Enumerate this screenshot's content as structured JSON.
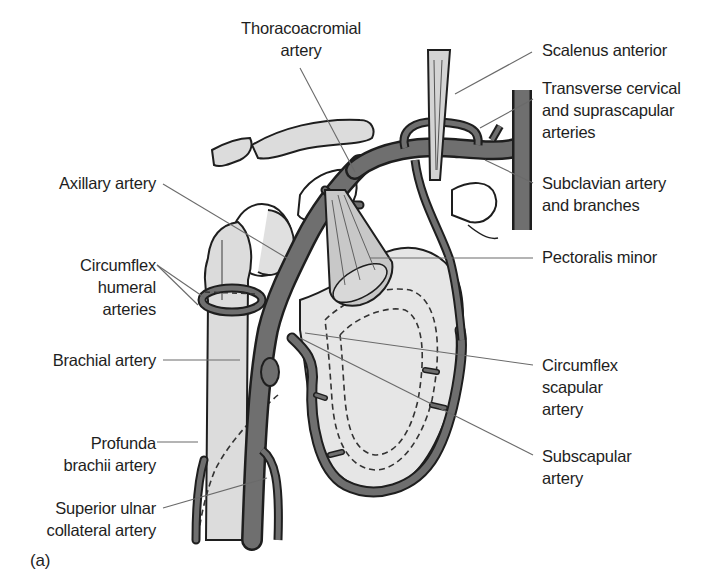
{
  "figure": {
    "panel_label": "(a)",
    "colors": {
      "artery": "#6f6f6f",
      "outline": "#1e1e1e",
      "bone": "#dcdcdc",
      "scapula": "#e6e6e6",
      "muscle": "#c8c8c8",
      "leader": "#6a6a6a"
    }
  },
  "labels": {
    "thoracoacromial": [
      "Thoracoacromial",
      "artery"
    ],
    "scalenus": [
      "Scalenus anterior"
    ],
    "transverse": [
      "Transverse cervical",
      "and suprascapular",
      "arteries"
    ],
    "subclavian": [
      "Subclavian artery",
      "and branches"
    ],
    "axillary": [
      "Axillary artery"
    ],
    "pectoralis": [
      "Pectoralis minor"
    ],
    "circumflex_humeral": [
      "Circumflex",
      "humeral",
      "arteries"
    ],
    "brachial": [
      "Brachial artery"
    ],
    "circumflex_scapular": [
      "Circumflex",
      "scapular",
      "artery"
    ],
    "profunda": [
      "Profunda",
      "brachii artery"
    ],
    "subscapular": [
      "Subscapular",
      "artery"
    ],
    "superior_ulnar": [
      "Superior ulnar",
      "collateral artery"
    ]
  }
}
